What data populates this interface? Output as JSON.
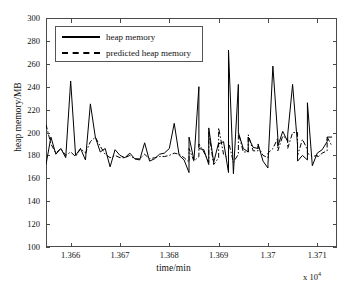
{
  "chart_data": {
    "type": "line",
    "title": "",
    "xlabel": "time/min",
    "ylabel": "heap memory/MB",
    "x_multiplier": "x 10",
    "x_multiplier_exp": "4",
    "xlim": [
      13655,
      13714
    ],
    "ylim": [
      100,
      300
    ],
    "yticks": [
      300,
      280,
      260,
      240,
      220,
      200,
      180,
      160,
      140,
      120,
      100
    ],
    "xticks": [
      13660,
      13670,
      13680,
      13690,
      13700,
      13710
    ],
    "xtick_labels": [
      "1.366",
      "1.367",
      "1.368",
      "1.369",
      "1.37",
      "1.371"
    ],
    "grid": false,
    "legend_position": "top-left",
    "legend": [
      {
        "label": "heap memory",
        "style": "solid",
        "color": "#000000"
      },
      {
        "label": "predicted heap memory",
        "style": "dash-dot",
        "color": "#000000"
      }
    ],
    "x": [
      13655,
      13656,
      13657,
      13658,
      13659,
      13660,
      13661,
      13662,
      13663,
      13664,
      13665,
      13666,
      13667,
      13668,
      13669,
      13670,
      13671,
      13672,
      13673,
      13674,
      13675,
      13676,
      13677,
      13678,
      13679,
      13680,
      13681,
      13682,
      13683,
      13684,
      13685,
      13686,
      13687,
      13688,
      13689,
      13690,
      13691,
      13692,
      13693,
      13694,
      13695,
      13696,
      13697,
      13698,
      13699,
      13700,
      13701,
      13702,
      13703,
      13704,
      13705,
      13706,
      13707,
      13708,
      13709,
      13710,
      13711,
      13712,
      13713
    ],
    "series": [
      {
        "name": "heap memory",
        "style": "solid",
        "color": "#000000",
        "values": [
          172,
          196,
          181,
          186,
          178,
          245,
          180,
          186,
          176,
          225,
          196,
          183,
          186,
          170,
          185,
          180,
          178,
          182,
          177,
          176,
          191,
          175,
          177,
          181,
          182,
          186,
          208,
          180,
          176,
          165,
          176,
          240,
          185,
          172,
          174,
          191,
          192,
          165,
          164,
          242,
          186,
          183,
          187,
          186,
          175,
          169,
          258,
          196,
          201,
          192,
          242,
          189,
          180,
          176,
          171,
          182,
          185,
          192,
          196
        ]
      },
      {
        "name": "predicted heap memory",
        "style": "dash-dot",
        "color": "#000000",
        "values": [
          207,
          190,
          182,
          186,
          180,
          183,
          179,
          186,
          182,
          192,
          196,
          188,
          181,
          178,
          180,
          178,
          178,
          180,
          177,
          177,
          181,
          177,
          178,
          179,
          179,
          180,
          182,
          181,
          178,
          174,
          175,
          179,
          183,
          174,
          172,
          178,
          181,
          177,
          174,
          181,
          183,
          183,
          184,
          184,
          180,
          178,
          186,
          195,
          197,
          194,
          200,
          200,
          194,
          185,
          179,
          180,
          182,
          184,
          188
        ]
      }
    ],
    "series_tail": {
      "x": [
        13684,
        13686,
        13688,
        13690,
        13692,
        13694,
        13696,
        13698,
        13700,
        13702,
        13704,
        13706,
        13708,
        13710,
        13712
      ],
      "heap": [
        196,
        186,
        204,
        190,
        272,
        200,
        196,
        190,
        172,
        188,
        198,
        175,
        226,
        182,
        196
      ],
      "predicted": [
        186,
        190,
        200,
        204,
        192,
        200,
        198,
        188,
        182,
        184,
        186,
        180,
        182,
        178,
        196
      ]
    }
  },
  "caption": {
    "text": ""
  }
}
